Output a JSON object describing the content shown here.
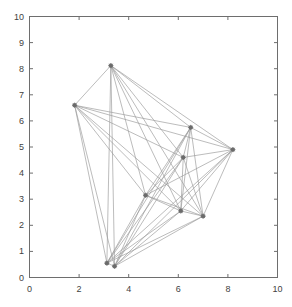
{
  "figure": {
    "background": "#ffffff",
    "axis_color": "#6e6e6e",
    "edge_color": "#9a9a9a",
    "node_color": "#6b6b6b",
    "tick_text_color": "#3f3f3f"
  },
  "chart_data": {
    "type": "scatter",
    "title": "",
    "xlabel": "",
    "ylabel": "",
    "xlim": [
      0,
      10
    ],
    "ylim": [
      0,
      10
    ],
    "grid": false,
    "legend": null,
    "xticks": [
      0,
      2,
      4,
      6,
      8,
      10
    ],
    "xticklabels": [
      "0",
      "2",
      "4",
      "6",
      "8",
      "10"
    ],
    "yticks": [
      0,
      1,
      2,
      3,
      4,
      5,
      6,
      7,
      8,
      9,
      10
    ],
    "yticklabels": [
      "0",
      "1",
      "2",
      "3",
      "4",
      "5",
      "6",
      "7",
      "8",
      "9",
      "10"
    ],
    "node_labels": [
      "n1",
      "n2",
      "n3",
      "n4",
      "n5",
      "n6",
      "n7",
      "n8",
      "n9",
      "n10"
    ],
    "x": [
      1.82,
      3.28,
      3.12,
      3.43,
      4.68,
      6.1,
      6.2,
      6.5,
      7.0,
      8.2
    ],
    "y": [
      6.6,
      8.12,
      0.55,
      0.43,
      3.15,
      2.55,
      4.6,
      5.75,
      2.35,
      4.9
    ],
    "edges": [
      [
        0,
        1
      ],
      [
        0,
        2
      ],
      [
        0,
        3
      ],
      [
        0,
        4
      ],
      [
        0,
        5
      ],
      [
        0,
        6
      ],
      [
        0,
        7
      ],
      [
        0,
        8
      ],
      [
        0,
        9
      ],
      [
        1,
        2
      ],
      [
        1,
        3
      ],
      [
        1,
        4
      ],
      [
        1,
        5
      ],
      [
        1,
        6
      ],
      [
        1,
        7
      ],
      [
        1,
        8
      ],
      [
        1,
        9
      ],
      [
        2,
        3
      ],
      [
        2,
        4
      ],
      [
        2,
        5
      ],
      [
        2,
        6
      ],
      [
        2,
        7
      ],
      [
        2,
        8
      ],
      [
        2,
        9
      ],
      [
        3,
        4
      ],
      [
        3,
        5
      ],
      [
        3,
        6
      ],
      [
        3,
        7
      ],
      [
        3,
        8
      ],
      [
        3,
        9
      ],
      [
        4,
        5
      ],
      [
        4,
        6
      ],
      [
        4,
        7
      ],
      [
        4,
        8
      ],
      [
        4,
        9
      ],
      [
        5,
        6
      ],
      [
        5,
        7
      ],
      [
        5,
        8
      ],
      [
        5,
        9
      ],
      [
        6,
        7
      ],
      [
        6,
        8
      ],
      [
        6,
        9
      ],
      [
        7,
        8
      ],
      [
        7,
        9
      ],
      [
        8,
        9
      ]
    ]
  }
}
